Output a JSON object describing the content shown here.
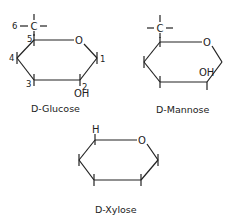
{
  "molecules": [
    {
      "name": "D-Glucose",
      "ring_oxygen": "O",
      "substituents": {
        "c6_carbon": "C",
        "c2_group": "OH"
      },
      "atom_numbers": [
        "1",
        "2",
        "3",
        "4",
        "5",
        "6"
      ]
    },
    {
      "name": "D-Mannose",
      "ring_oxygen": "O",
      "substituents": {
        "c6_carbon": "C",
        "c2_group": "OH"
      }
    },
    {
      "name": "D-Xylose",
      "ring_oxygen": "O",
      "substituents": {
        "c5_group": "H"
      }
    }
  ]
}
